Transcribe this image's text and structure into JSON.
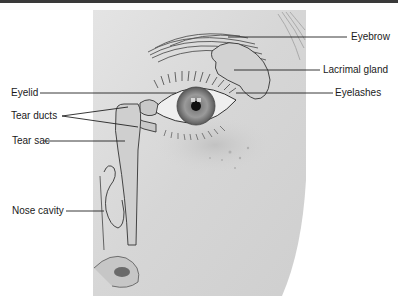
{
  "figure": {
    "colors": {
      "background": "#ffffff",
      "top_bar": "#3a3a3a",
      "illustration_bg": "#dcdcdc",
      "line": "#222222",
      "label_text": "#1a1a1a"
    },
    "labels": {
      "eyebrow": "Eyebrow",
      "lacrimal_gland": "Lacrimal gland",
      "eyelashes": "Eyelashes",
      "eyelid": "Eyelid",
      "tear_ducts": "Tear ducts",
      "tear_sac": "Tear sac",
      "nose_cavity": "Nose cavity"
    }
  }
}
